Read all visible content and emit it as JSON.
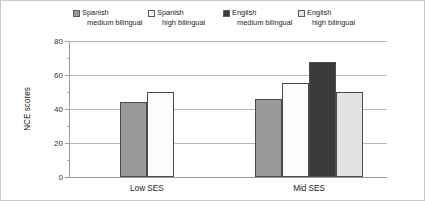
{
  "chart_data": {
    "type": "bar",
    "title": "",
    "xlabel": "",
    "ylabel": "NCE scores",
    "ylim": [
      0,
      80
    ],
    "ytick_labels": [
      "0",
      "20",
      "40",
      "60",
      "80"
    ],
    "ytick_values": [
      0,
      20,
      40,
      60,
      80
    ],
    "yminor_values": [
      10,
      30,
      50,
      70
    ],
    "grid": true,
    "legend_position": "top",
    "categories": [
      "Low SES",
      "Mid SES"
    ],
    "series": [
      {
        "name": "Spanish medium bilingual",
        "label_line1": "Spanish",
        "label_line2": "medium bilingual",
        "color": "#9a9a9a",
        "values": [
          44,
          46
        ]
      },
      {
        "name": "Spanish high bilingual",
        "label_line1": "Spanish",
        "label_line2": "high bilingual",
        "color": "#fcfcfc",
        "values": [
          50,
          55.5
        ]
      },
      {
        "name": "English medium bilingual",
        "label_line1": "English",
        "label_line2": "medium bilingual",
        "color": "#3a3a3a",
        "values": [
          null,
          67.5
        ]
      },
      {
        "name": "English high bilingual",
        "label_line1": "English",
        "label_line2": "high bilingual",
        "color": "#e2e2e2",
        "values": [
          null,
          50
        ]
      }
    ]
  }
}
